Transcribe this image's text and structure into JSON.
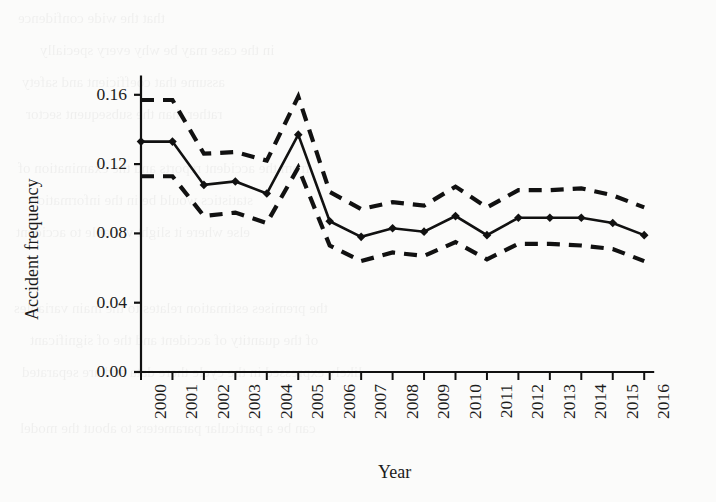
{
  "figure": {
    "background_color": "#fbfbfa",
    "ink_color": "#111111",
    "x_axis_title": "Year",
    "y_axis_title": "Accident frequency"
  },
  "chart_data": {
    "type": "line",
    "title": "",
    "xlabel": "Year",
    "ylabel": "Accident frequency",
    "categories": [
      "2000",
      "2001",
      "2002",
      "2003",
      "2004",
      "2005",
      "2006",
      "2007",
      "2008",
      "2009",
      "2010",
      "2011",
      "2012",
      "2013",
      "2014",
      "2015",
      "2016"
    ],
    "x": [
      2000,
      2001,
      2002,
      2003,
      2004,
      2005,
      2006,
      2007,
      2008,
      2009,
      2010,
      2011,
      2012,
      2013,
      2014,
      2015,
      2016
    ],
    "xlim": [
      2000,
      2016
    ],
    "ylim": [
      0.0,
      0.17
    ],
    "ytick_labels": [
      "0.00",
      "0.04",
      "0.08",
      "0.12",
      "0.16"
    ],
    "ytick_values": [
      0.0,
      0.04,
      0.08,
      0.12,
      0.16
    ],
    "grid": false,
    "legend": false,
    "series": [
      {
        "name": "Accident frequency",
        "style": "solid",
        "marker": "diamond",
        "values": [
          0.133,
          0.133,
          0.108,
          0.11,
          0.103,
          0.137,
          0.087,
          0.078,
          0.083,
          0.081,
          0.09,
          0.079,
          0.089,
          0.089,
          0.089,
          0.086,
          0.079
        ]
      },
      {
        "name": "Upper confidence bound",
        "style": "dashed",
        "marker": "none",
        "values": [
          0.157,
          0.157,
          0.126,
          0.127,
          0.122,
          0.159,
          0.104,
          0.094,
          0.098,
          0.096,
          0.107,
          0.095,
          0.105,
          0.105,
          0.106,
          0.102,
          0.095
        ]
      },
      {
        "name": "Lower confidence bound",
        "style": "dashed",
        "marker": "none",
        "values": [
          0.113,
          0.113,
          0.09,
          0.092,
          0.086,
          0.118,
          0.073,
          0.064,
          0.069,
          0.067,
          0.075,
          0.065,
          0.074,
          0.074,
          0.073,
          0.071,
          0.064
        ]
      }
    ]
  },
  "bleed_text": [
    {
      "t": "that the wide confidence",
      "x": 18,
      "y": 10,
      "s": 15
    },
    {
      "t": "in the case may be why every specially",
      "x": 40,
      "y": 42,
      "s": 15
    },
    {
      "t": "assume that coefficient and safety",
      "x": 22,
      "y": 74,
      "s": 15
    },
    {
      "t": "rather than the subsequent sector",
      "x": 26,
      "y": 106,
      "s": 15
    },
    {
      "t": "from the accident reports and the examination of",
      "x": 18,
      "y": 160,
      "s": 15
    },
    {
      "t": "statistics would be in the information",
      "x": 30,
      "y": 192,
      "s": 15
    },
    {
      "t": "else where it slight variable to accident",
      "x": 16,
      "y": 224,
      "s": 15
    },
    {
      "t": "the premises estimation relates to the main variables",
      "x": 14,
      "y": 300,
      "s": 15
    },
    {
      "t": "of the quantity of accident and the of significant",
      "x": 30,
      "y": 332,
      "s": 15
    },
    {
      "t": "likely expressed in the cycle there data and are separated",
      "x": 22,
      "y": 364,
      "s": 15
    },
    {
      "t": "can be a particular parameters to about the model",
      "x": 20,
      "y": 420,
      "s": 15
    }
  ]
}
